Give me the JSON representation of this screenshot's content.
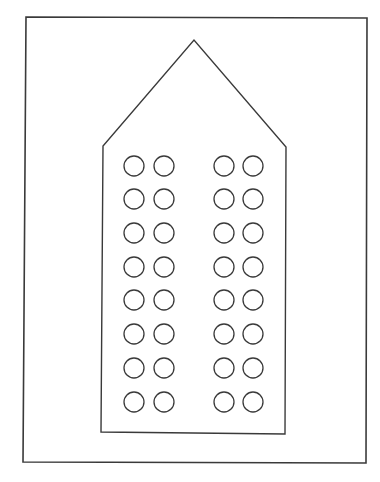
{
  "diagram": {
    "colors": {
      "background": "#ffffff",
      "stroke": "#3a3a3a"
    },
    "frame": {
      "x1": 26,
      "y1": 17,
      "x2": 367,
      "y2": 463
    },
    "house": {
      "apex": [
        194,
        40
      ],
      "left_shoulder": [
        103,
        146
      ],
      "right_shoulder": [
        286,
        147
      ],
      "bottom_left": [
        101,
        432
      ],
      "bottom_right": [
        285,
        434
      ]
    },
    "windows": {
      "shape": "circle",
      "radius": 10,
      "column_x": [
        134,
        164,
        224,
        253
      ],
      "row_y": [
        166,
        199,
        233,
        267,
        300,
        334,
        368,
        402
      ],
      "rows": 8,
      "columns": 4,
      "groups": 2,
      "total": 32
    }
  }
}
